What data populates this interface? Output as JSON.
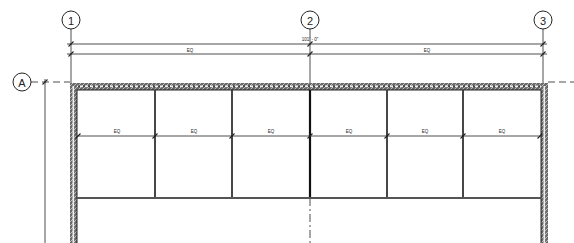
{
  "drawing": {
    "type": "architectural floor plan / curtain wall elevation",
    "grid_lines": {
      "vertical": [
        {
          "label": "1",
          "x": 71
        },
        {
          "label": "2",
          "x": 310
        },
        {
          "label": "3",
          "x": 543
        }
      ],
      "horizontal": [
        {
          "label": "A",
          "y": 82
        }
      ]
    },
    "dimensions": {
      "overall": {
        "text": "101' - 0\"",
        "from": "1",
        "to": "3"
      },
      "segments": [
        {
          "text": "EQ",
          "from": "1",
          "to": "2"
        },
        {
          "text": "EQ",
          "from": "2",
          "to": "3"
        }
      ],
      "bay_dimensions": [
        "EQ",
        "EQ",
        "EQ",
        "EQ",
        "EQ",
        "EQ"
      ]
    },
    "bays": 6,
    "colors": {
      "line": "#222222",
      "wall_hatch": "#555555",
      "background": "#ffffff"
    }
  }
}
